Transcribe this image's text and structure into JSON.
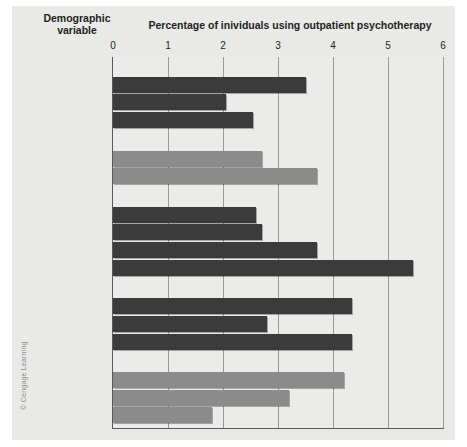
{
  "figure": {
    "credit": "© Cengage Learning",
    "demographic_header_line1": "Demographic",
    "demographic_header_line2": "variable"
  },
  "chart_data": {
    "type": "bar",
    "orientation": "horizontal",
    "title": "Percentage of inividuals using outpatient psychotherapy",
    "xlabel": "Percentage of inividuals using outpatient psychotherapy",
    "ylabel": "Demographic variable",
    "xlim": [
      0,
      6
    ],
    "xticks": [
      0,
      1,
      2,
      3,
      4,
      5,
      6
    ],
    "xtick_labels": [
      "0",
      "1",
      "2",
      "3",
      "4",
      "5",
      "6"
    ],
    "grid": true,
    "legend": null,
    "colors": {
      "dark_bar": "#3b3b3b",
      "light_bar": "#8b8b8b",
      "plot_background": "#ebebe9",
      "panel_background": "#e9e9e7",
      "axis": "#58595b",
      "gridline": "#b3b3b1",
      "group_muted_text": "#9a9a98"
    },
    "groups": [
      {
        "name": "Race/ethnicity",
        "style": "dark",
        "muted_heading": false,
        "categories": [
          "White",
          "Black",
          "Hispanic"
        ],
        "values": [
          3.5,
          2.05,
          2.55
        ]
      },
      {
        "name": "Sex",
        "style": "light",
        "muted_heading": true,
        "categories": [
          "Male",
          "Female"
        ],
        "values": [
          2.7,
          3.7
        ]
      },
      {
        "name": "Education",
        "style": "dark",
        "muted_heading": false,
        "categories": [
          "Under 12 years",
          "12 years",
          "13–16 years",
          "17 years and over"
        ],
        "values": [
          2.6,
          2.7,
          3.7,
          5.45
        ]
      },
      {
        "name": "Marital status",
        "style": "dark",
        "muted_heading": false,
        "categories": [
          "Not married",
          "Married",
          "Divorced/separated"
        ],
        "values": [
          4.35,
          2.8,
          4.35
        ]
      },
      {
        "name": "Health insurance",
        "style": "light",
        "muted_heading": true,
        "categories": [
          "Public",
          "Private",
          "None"
        ],
        "values": [
          4.2,
          3.2,
          1.8
        ]
      }
    ]
  }
}
